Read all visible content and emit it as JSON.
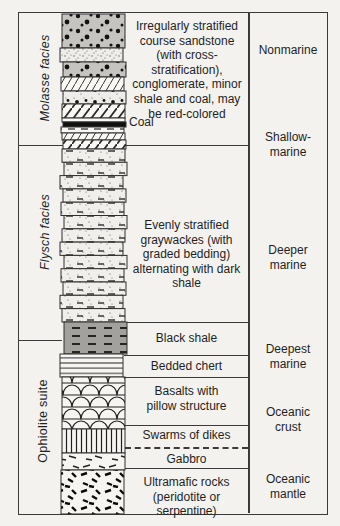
{
  "left_labels": [
    {
      "label": "Molasse facies"
    },
    {
      "label": "Flysch facies"
    },
    {
      "label": "Ophiolite suite"
    }
  ],
  "descriptions": {
    "molasse": "Irregularly stratified\ncourse sandstone\n(with cross-\nstratification),\nconglomerate, minor\nshale and coal, may\nbe red-colored",
    "coal": "Coal",
    "flysch": "Evenly stratified\ngraywackes (with\ngraded bedding)\nalternating with dark\nshale",
    "black_shale": "Black shale",
    "bedded_chert": "Bedded chert",
    "basalts": "Basalts with\npillow structure",
    "dikes": "Swarms of dikes",
    "gabbro": "Gabbro",
    "ultramafic": "Ultramafic rocks\n(peridotite or serpentine)"
  },
  "environments": [
    {
      "label": "Nonmarine"
    },
    {
      "label": "Shallow-\nmarine"
    },
    {
      "label": "Deeper\nmarine"
    },
    {
      "label": "Deepest\nmarine"
    },
    {
      "label": "Oceanic\ncrust"
    },
    {
      "label": "Oceanic\nmantle"
    }
  ],
  "colors": {
    "line": "#3a3a3a",
    "text": "#1f1f1f",
    "conglomerate_gray": "#c6c4c0",
    "black_shale_gray": "#a3a19d",
    "coal_black": "#101010",
    "paper": "#f3f2ee"
  },
  "column": {
    "layers": [
      {
        "name": "conglomerate",
        "y": 2,
        "h": 34,
        "dx": 0,
        "fill": "#c6c4c0",
        "pattern": "p-congl"
      },
      {
        "name": "stippled-sandstone",
        "y": 36,
        "h": 14,
        "dx": -2,
        "fill": "#efede9",
        "pattern": "p-stip"
      },
      {
        "name": "conglomerate",
        "y": 50,
        "h": 15,
        "dx": 1,
        "fill": "#c6c4c0",
        "pattern": "p-congl"
      },
      {
        "name": "cross-bedded-sandstone",
        "y": 65,
        "h": 14,
        "dx": -1,
        "fill": "#faf8f5",
        "pattern": "p-xbed"
      },
      {
        "name": "pebbly-sandstone",
        "y": 79,
        "h": 13,
        "dx": 1,
        "fill": "#efede9",
        "pattern": "p-pebb"
      },
      {
        "name": "cross-bedded-sandstone",
        "y": 92,
        "h": 14,
        "dx": 0,
        "fill": "#faf8f5",
        "pattern": "p-xbed2"
      },
      {
        "name": "shale",
        "y": 106,
        "h": 4,
        "dx": 0,
        "fill": "#faf8f5",
        "pattern": "p-shdash"
      },
      {
        "name": "coal-bed",
        "y": 110,
        "h": 5,
        "dx": 1,
        "fill": "#101010",
        "pattern": null
      },
      {
        "name": "shale",
        "y": 115,
        "h": 6,
        "dx": -1,
        "fill": "#faf8f5",
        "pattern": "p-shdash"
      },
      {
        "name": "cross-bedded-sandstone",
        "y": 121,
        "h": 7,
        "dx": 0,
        "fill": "#faf8f5",
        "pattern": "p-xbed"
      },
      {
        "name": "cross-bedded-sandstone",
        "y": 128,
        "h": 9,
        "dx": 1,
        "fill": "#faf8f5",
        "pattern": "p-xbed2"
      },
      {
        "name": "graywacke-bed",
        "y": 137,
        "h": 13.3,
        "dx": 0,
        "fill": "#f1efeb",
        "pattern": "p-gray"
      },
      {
        "name": "graywacke-bed",
        "y": 150.3,
        "h": 13.3,
        "dx": 2,
        "fill": "#f1efeb",
        "pattern": "p-gray"
      },
      {
        "name": "graywacke-bed",
        "y": 163.6,
        "h": 13.3,
        "dx": -2,
        "fill": "#f1efeb",
        "pattern": "p-gray"
      },
      {
        "name": "graywacke-bed",
        "y": 176.9,
        "h": 13.3,
        "dx": 1,
        "fill": "#f1efeb",
        "pattern": "p-gray"
      },
      {
        "name": "graywacke-bed",
        "y": 190.2,
        "h": 13.3,
        "dx": -1,
        "fill": "#f1efeb",
        "pattern": "p-gray"
      },
      {
        "name": "graywacke-bed",
        "y": 203.5,
        "h": 13.3,
        "dx": 2,
        "fill": "#f1efeb",
        "pattern": "p-gray"
      },
      {
        "name": "graywacke-bed",
        "y": 216.8,
        "h": 13.3,
        "dx": 0,
        "fill": "#f1efeb",
        "pattern": "p-gray"
      },
      {
        "name": "graywacke-bed",
        "y": 230.1,
        "h": 13.3,
        "dx": -2,
        "fill": "#f1efeb",
        "pattern": "p-gray"
      },
      {
        "name": "graywacke-bed",
        "y": 243.4,
        "h": 13.3,
        "dx": 2,
        "fill": "#f1efeb",
        "pattern": "p-gray"
      },
      {
        "name": "graywacke-bed",
        "y": 256.7,
        "h": 13.3,
        "dx": -1,
        "fill": "#f1efeb",
        "pattern": "p-gray"
      },
      {
        "name": "graywacke-bed",
        "y": 270,
        "h": 13.3,
        "dx": 1,
        "fill": "#f1efeb",
        "pattern": "p-gray"
      },
      {
        "name": "graywacke-bed",
        "y": 283.3,
        "h": 13.3,
        "dx": -2,
        "fill": "#f1efeb",
        "pattern": "p-gray"
      },
      {
        "name": "graywacke-bed",
        "y": 296.6,
        "h": 13.4,
        "dx": 0,
        "fill": "#f1efeb",
        "pattern": "p-gray"
      },
      {
        "name": "black-shale",
        "y": 310,
        "h": 32,
        "dx": 2,
        "fill": "#a3a19d",
        "pattern": "p-bsdash"
      },
      {
        "name": "bedded-chert",
        "y": 342,
        "h": 23,
        "dx": -2,
        "fill": "#f7f5f2",
        "pattern": "p-chert"
      },
      {
        "name": "pillow-basalt",
        "y": 365,
        "h": 52,
        "dx": 0,
        "fill": "#f7f5f2",
        "pattern": "p-pill"
      },
      {
        "name": "sheeted-dikes",
        "y": 417,
        "h": 24,
        "dx": 0,
        "fill": "#f7f5f2",
        "pattern": "p-dike"
      },
      {
        "name": "gabbro",
        "y": 441,
        "h": 17,
        "dx": 0,
        "fill": "#f7f5f2",
        "pattern": "p-gab"
      },
      {
        "name": "ultramafic-rock",
        "y": 458,
        "h": 44,
        "dx": -1,
        "fill": "#f7f5f2",
        "pattern": "p-ultra"
      }
    ]
  }
}
